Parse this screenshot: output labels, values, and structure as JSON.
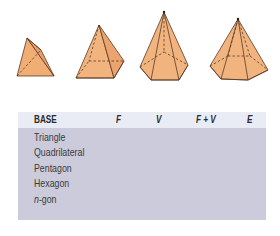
{
  "figure": {
    "caption_items": [
      {
        "name": "triangular-pyramid",
        "base": "Triangle"
      },
      {
        "name": "square-pyramid",
        "base": "Quadrilateral"
      },
      {
        "name": "pentagonal-pyramid",
        "base": "Pentagon"
      },
      {
        "name": "hexagonal-pyramid",
        "base": "Hexagon"
      }
    ],
    "fill_color": "#f2b47e",
    "edge_color": "#5a3a28"
  },
  "table": {
    "header_bg": "#e9ecf5",
    "body_bg": "#cccbdc",
    "columns": [
      "BASE",
      "F",
      "V",
      "F + V",
      "E"
    ],
    "rows": [
      {
        "base": "Triangle"
      },
      {
        "base": "Quadrilateral"
      },
      {
        "base": "Pentagon"
      },
      {
        "base": "Hexagon"
      },
      {
        "base_prefix": "n",
        "base_suffix": "-gon"
      }
    ]
  }
}
